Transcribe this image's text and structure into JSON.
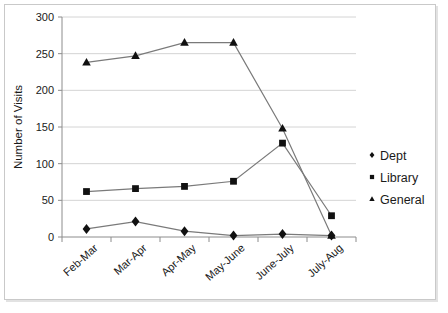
{
  "chart_data": {
    "type": "line",
    "title": "",
    "xlabel": "",
    "ylabel": "Number of Visits",
    "categories": [
      "Feb-Mar",
      "Mar-Apr",
      "Apr-May",
      "May-June",
      "June-July",
      "July-Aug"
    ],
    "ylim": [
      0,
      300
    ],
    "yticks": [
      0,
      50,
      100,
      150,
      200,
      250,
      300
    ],
    "ytick_labels": [
      "0",
      "50",
      "100",
      "150",
      "200",
      "250",
      "300"
    ],
    "grid": true,
    "legend_position": "right",
    "series": [
      {
        "name": "Dept",
        "marker": "diamond",
        "color": "#111111",
        "values": [
          11,
          21,
          8,
          2,
          4,
          2
        ]
      },
      {
        "name": "Library",
        "marker": "square",
        "color": "#111111",
        "values": [
          62,
          66,
          69,
          76,
          128,
          29
        ]
      },
      {
        "name": "General",
        "marker": "triangle",
        "color": "#111111",
        "values": [
          238,
          247,
          265,
          265,
          148,
          2
        ]
      }
    ]
  },
  "legend": {
    "items": [
      {
        "label": "Dept",
        "marker": "diamond"
      },
      {
        "label": "Library",
        "marker": "square"
      },
      {
        "label": "General",
        "marker": "triangle"
      }
    ]
  },
  "axes": {
    "y_title": "Number of Visits"
  }
}
